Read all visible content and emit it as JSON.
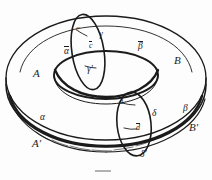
{
  "figure": {
    "kind": "torus-diagram",
    "ink_color": "#1b1b1b",
    "background_color": "#fdfdfd",
    "caption_mark": ""
  },
  "regions": {
    "A": "A",
    "Ap": "A′",
    "B": "B",
    "Bp": "B′"
  },
  "curves": {
    "alpha": "α",
    "alpha_bar": "α",
    "beta": "β",
    "beta_bar": "β",
    "gamma": "γ",
    "gamma_p": "γ′",
    "delta": "δ",
    "delta_p": "δ′"
  },
  "points": {
    "c": "c",
    "c_bar": "c",
    "d": "d",
    "d_bar": "d"
  }
}
